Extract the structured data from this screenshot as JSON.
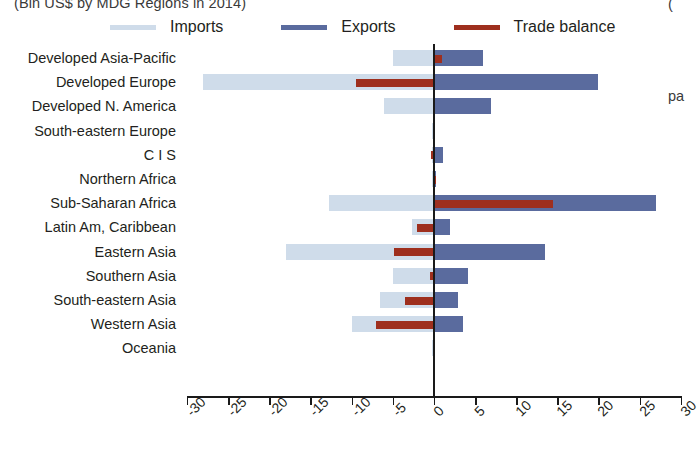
{
  "title_crop": "(Bln US$ by MDG Regions in 2014)",
  "right_crop_top": "(",
  "right_crop_mid": "pa",
  "legend": {
    "items": [
      {
        "label": "Imports",
        "color": "#cfdcea",
        "name": "imports"
      },
      {
        "label": "Exports",
        "color": "#5a6b9e",
        "name": "exports"
      },
      {
        "label": "Trade balance",
        "color": "#9e2f1e",
        "name": "trade-balance"
      }
    ]
  },
  "axis": {
    "ticks": [
      "-30",
      "-25",
      "-20",
      "-15",
      "-10",
      "-5",
      "0",
      "5",
      "10",
      "15",
      "20",
      "25",
      "30"
    ],
    "min": -30,
    "max": 30,
    "step": 5
  },
  "colors": {
    "imports": "#cfdcea",
    "exports": "#5a6b9e",
    "balance": "#9e2f1e",
    "axis": "#1a1a1a",
    "text": "#231f20"
  },
  "chart_data": {
    "type": "bar",
    "orientation": "horizontal",
    "title": "(Bln US$ by MDG Regions in 2014)",
    "xlabel": "",
    "ylabel": "",
    "xlim": [
      -30,
      30
    ],
    "grid": false,
    "legend_position": "top",
    "categories": [
      "Developed Asia-Pacific",
      "Developed Europe",
      "Developed N. America",
      "South-eastern Europe",
      "C I S",
      "Northern Africa",
      "Sub-Saharan Africa",
      "Latin Am, Caribbean",
      "Eastern Asia",
      "Southern Asia",
      "South-eastern Asia",
      "Western Asia",
      "Oceania"
    ],
    "series": [
      {
        "name": "Imports",
        "color": "#cfdcea",
        "values": [
          -5.0,
          -28.0,
          -6.0,
          -0.2,
          -0.2,
          -0.2,
          -12.7,
          -2.7,
          -18.0,
          -5.0,
          -6.5,
          -10.0,
          -0.2
        ]
      },
      {
        "name": "Exports",
        "color": "#5a6b9e",
        "values": [
          6.0,
          20.0,
          7.0,
          0.2,
          1.1,
          0.3,
          27.0,
          2.0,
          13.5,
          4.2,
          3.0,
          3.5,
          0.2
        ]
      },
      {
        "name": "Trade balance",
        "color": "#9e2f1e",
        "values": [
          1.0,
          -9.5,
          0.0,
          0.0,
          -0.3,
          0.3,
          14.5,
          -2.0,
          -4.8,
          -0.5,
          -3.5,
          -7.0,
          0.0
        ]
      }
    ]
  }
}
